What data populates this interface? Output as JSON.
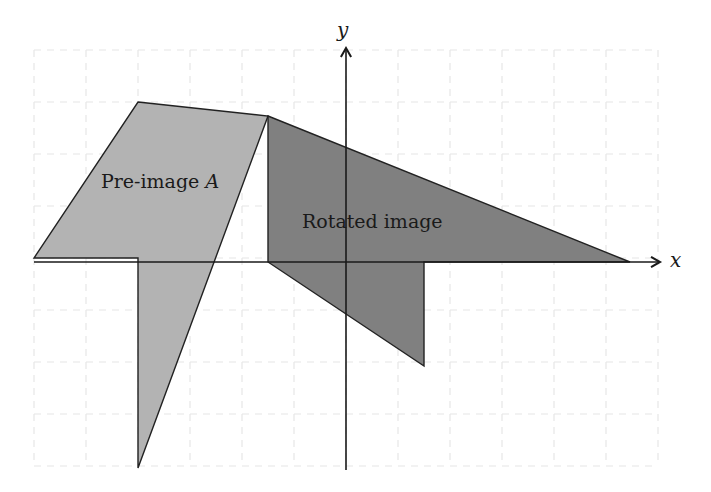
{
  "diagram": {
    "title": "",
    "axes": {
      "x_label": "x",
      "y_label": "y",
      "origin_px": [
        346,
        258
      ],
      "unit_px": 52,
      "grid": {
        "x_range": [
          -6,
          6
        ],
        "y_range": [
          -4,
          4
        ],
        "style": "dashed",
        "color": "#e6e6e6"
      },
      "axis_color": "#1a1a1a"
    },
    "shapes": [
      {
        "name": "Pre-image A",
        "label_text": "Pre-image ",
        "label_var": "A",
        "fill": "#b3b3b3",
        "stroke": "#222222",
        "points_px": [
          [
            138,
            102
          ],
          [
            268,
            116
          ],
          [
            138,
            468
          ],
          [
            138,
            258
          ],
          [
            34,
            258
          ]
        ]
      },
      {
        "name": "Rotated image",
        "label_text": "Rotated image",
        "fill": "#808080",
        "stroke": "#222222",
        "points_px": [
          [
            268,
            116
          ],
          [
            630,
            262
          ],
          [
            424,
            262
          ],
          [
            424,
            366
          ],
          [
            268,
            262
          ]
        ]
      }
    ]
  }
}
